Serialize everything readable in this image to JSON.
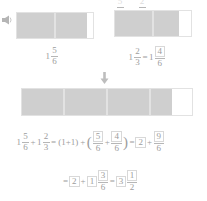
{
  "page": {
    "accent_fill": "#cfcfcf",
    "outline": "#e2e2e2",
    "text_color": "#9d9d9d"
  },
  "icons": {
    "speaker": "speaker-icon",
    "arrow": "down-arrow-icon"
  },
  "top_clip": {
    "left_frac": {
      "num": "5",
      "den": "6"
    },
    "right_frac": {
      "num": "2",
      "den": "3"
    }
  },
  "models": [
    {
      "name": "first-addend-model",
      "label": {
        "whole": "1",
        "num": "5",
        "den": "6"
      },
      "cells": [
        {
          "fill_percent": 100
        },
        {
          "fill_percent": 83
        }
      ]
    },
    {
      "name": "second-addend-model",
      "label": {
        "whole": "1",
        "num": "2",
        "den": "3",
        "equals": "=",
        "result_whole": "1",
        "result_num": "4",
        "result_den": "6",
        "result_num_boxed": true
      },
      "cells": [
        {
          "fill_percent": 100
        },
        {
          "fill_percent": 67
        }
      ]
    },
    {
      "name": "sum-model",
      "cells": [
        {
          "fill_percent": 100
        },
        {
          "fill_percent": 100
        },
        {
          "fill_percent": 100
        },
        {
          "fill_percent": 50
        }
      ]
    }
  ],
  "equation_line_1": {
    "terms": [
      {
        "type": "mixed",
        "whole": "1",
        "num": "5",
        "den": "6"
      },
      {
        "type": "op",
        "text": "+"
      },
      {
        "type": "mixed",
        "whole": "1",
        "num": "2",
        "den": "3"
      },
      {
        "type": "op",
        "text": "="
      },
      {
        "type": "op",
        "text": "(1+1)"
      },
      {
        "type": "op",
        "text": "+"
      },
      {
        "type": "paren",
        "text": "("
      },
      {
        "type": "frac",
        "num": "5",
        "den": "6",
        "num_boxed": true
      },
      {
        "type": "op",
        "text": "+"
      },
      {
        "type": "frac",
        "num": "4",
        "den": "6",
        "num_boxed": true
      },
      {
        "type": "paren",
        "text": ")"
      },
      {
        "type": "op",
        "text": "="
      },
      {
        "type": "boxed",
        "text": "2"
      },
      {
        "type": "op",
        "text": "+"
      },
      {
        "type": "frac",
        "num": "9",
        "den": "6",
        "num_boxed": true
      }
    ]
  },
  "equation_line_2": {
    "terms": [
      {
        "type": "op",
        "text": "="
      },
      {
        "type": "boxed",
        "text": "2"
      },
      {
        "type": "op",
        "text": "+"
      },
      {
        "type": "boxed",
        "text": "1"
      },
      {
        "type": "frac",
        "num": "3",
        "den": "6",
        "num_boxed": true
      },
      {
        "type": "op",
        "text": "="
      },
      {
        "type": "boxed",
        "text": "3"
      },
      {
        "type": "frac",
        "num": "1",
        "den": "2",
        "num_boxed": true
      }
    ]
  }
}
